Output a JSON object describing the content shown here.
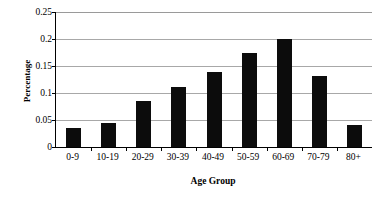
{
  "chart_data": {
    "type": "bar",
    "title": "",
    "subtitle": "",
    "xlabel": "Age Group",
    "ylabel": "Percentage",
    "categories": [
      "0-9",
      "10-19",
      "20-29",
      "30-39",
      "40-49",
      "50-59",
      "60-69",
      "70-79",
      "80+"
    ],
    "values": [
      0.036,
      0.045,
      0.085,
      0.111,
      0.139,
      0.174,
      0.2,
      0.132,
      0.041
    ],
    "series": [
      {
        "name": "Percentage",
        "values": [
          0.036,
          0.045,
          0.085,
          0.111,
          0.139,
          0.174,
          0.2,
          0.132,
          0.041
        ]
      }
    ],
    "ylim": [
      0,
      0.25
    ],
    "yticks": [
      0,
      0.05,
      0.1,
      0.15,
      0.2,
      0.25
    ],
    "ytick_labels": [
      "0",
      "0.05",
      "0.1",
      "0.15",
      "0.2",
      "0.25"
    ],
    "grid": "horizontal",
    "legend": "none",
    "bar_color": "#0c0c0c",
    "gridline_color": "#a8a8a8",
    "axis_color": "#000000",
    "background_color": "#ffffff",
    "annotations": []
  }
}
